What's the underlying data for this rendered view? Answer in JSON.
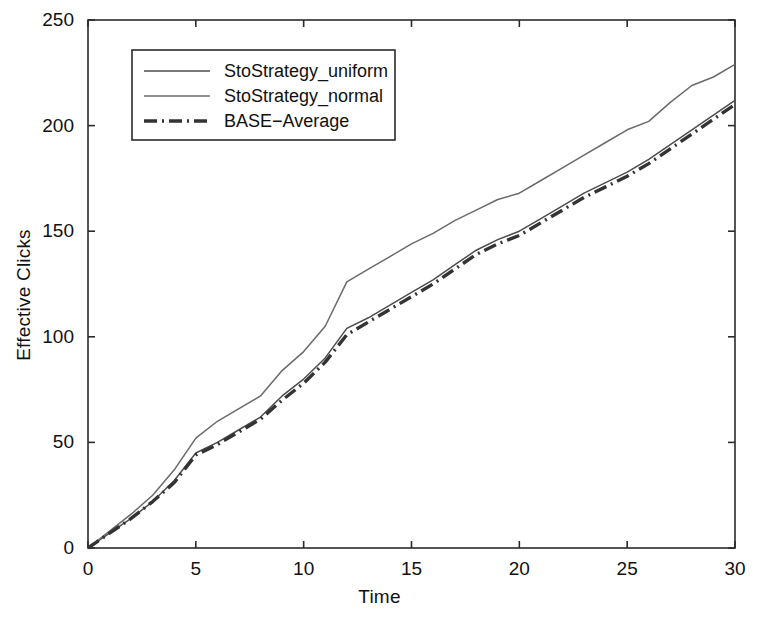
{
  "chart_data": {
    "type": "line",
    "title": "",
    "xlabel": "Time",
    "ylabel": "Effective Clicks",
    "xlim": [
      0,
      30
    ],
    "ylim": [
      0,
      250
    ],
    "xticks": [
      "0",
      "5",
      "10",
      "15",
      "20",
      "25",
      "30"
    ],
    "yticks": [
      "0",
      "50",
      "100",
      "150",
      "200",
      "250"
    ],
    "xtick_values": [
      0,
      5,
      10,
      15,
      20,
      25,
      30
    ],
    "ytick_values": [
      0,
      50,
      100,
      150,
      200,
      250
    ],
    "grid": false,
    "legend_position": "upper-left",
    "x": [
      0,
      1,
      2,
      3,
      4,
      5,
      6,
      7,
      8,
      9,
      10,
      11,
      12,
      13,
      14,
      15,
      16,
      17,
      18,
      19,
      20,
      21,
      22,
      23,
      24,
      25,
      26,
      27,
      28,
      29,
      30
    ],
    "series": [
      {
        "name": "StoStrategy_uniform",
        "style": "solid",
        "color": "#4d4d4d",
        "values": [
          0,
          7,
          14,
          22,
          32,
          45,
          50,
          56,
          62,
          72,
          80,
          90,
          104,
          109,
          115,
          121,
          127,
          134,
          141,
          146,
          150,
          156,
          162,
          168,
          173,
          178,
          184,
          191,
          198,
          205,
          212
        ]
      },
      {
        "name": "StoStrategy_normal",
        "style": "solid",
        "color": "#6a6a6a",
        "values": [
          0,
          8,
          16,
          25,
          37,
          52,
          60,
          66,
          72,
          84,
          93,
          105,
          126,
          132,
          138,
          144,
          149,
          155,
          160,
          165,
          168,
          174,
          180,
          186,
          192,
          198,
          202,
          211,
          219,
          223,
          229
        ]
      },
      {
        "name": "BASE-Average",
        "style": "dashdot",
        "color": "#333333",
        "values": [
          0,
          7,
          14,
          22,
          31,
          44,
          49,
          55,
          61,
          70,
          78,
          88,
          101,
          107,
          113,
          119,
          125,
          132,
          139,
          144,
          148,
          154,
          160,
          166,
          171,
          176,
          182,
          189,
          196,
          203,
          210
        ]
      }
    ],
    "legend_entries": [
      {
        "label": "StoStrategy_uniform",
        "style": "solid"
      },
      {
        "label": "StoStrategy_normal",
        "style": "solid"
      },
      {
        "label": "BASE−Average",
        "style": "dashdot"
      }
    ]
  },
  "axes": {
    "frame_color": "#2b2b2b"
  }
}
